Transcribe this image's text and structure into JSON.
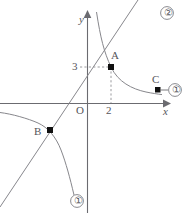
{
  "figure": {
    "kind": "coordinate-plane-graph",
    "background_color": "#ffffff",
    "stroke_color": "#6b6b70",
    "label_color": "#55555a",
    "marker_color": "#111111",
    "axes": {
      "x_axis_label": "x",
      "y_axis_label": "y",
      "origin_label": "O",
      "x_tick_labels": [
        "2"
      ],
      "y_tick_labels": [
        "3"
      ],
      "x_arrow": true,
      "y_arrow": true
    },
    "points": [
      {
        "name": "A",
        "label": "A",
        "coords": [
          2,
          3
        ],
        "marker": "filled-square"
      },
      {
        "name": "B",
        "label": "B",
        "coords": [
          -2,
          -3
        ],
        "marker": "filled-square"
      },
      {
        "name": "C",
        "label": "C",
        "coords": [
          4.7,
          1.3
        ],
        "marker": "filled-square"
      }
    ],
    "curves": [
      {
        "id": "1",
        "label": "①",
        "type": "hyperbola",
        "description": "y = 6/x, two branches"
      },
      {
        "id": "2",
        "label": "②",
        "type": "line",
        "description": "y = 1.5x through origin"
      }
    ],
    "curve_labels": [
      {
        "text": "②",
        "position": "top-right"
      },
      {
        "text": "①",
        "position": "right"
      },
      {
        "text": "①",
        "position": "bottom"
      }
    ],
    "guide_lines": {
      "style": "dashed",
      "from_point": "A",
      "to_axes": [
        "x",
        "y"
      ]
    }
  }
}
